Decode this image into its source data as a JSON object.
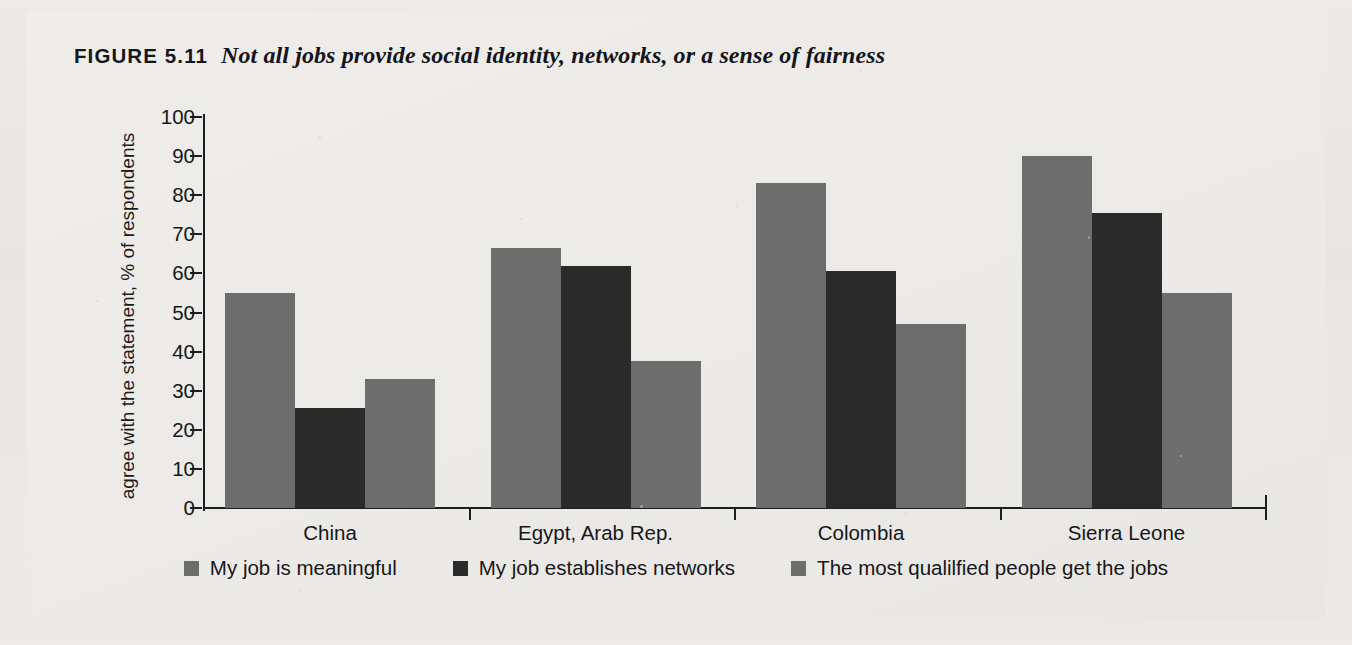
{
  "figure": {
    "label": "FIGURE 5.11",
    "title": "Not all jobs provide social identity, networks, or a sense of fairness"
  },
  "axes": {
    "ylabel": "agree with the statement, % of respondents",
    "yticks": [
      "0",
      "10",
      "20",
      "30",
      "40",
      "50",
      "60",
      "70",
      "80",
      "90",
      "100"
    ],
    "ymin": 0,
    "ymax": 100
  },
  "legend": [
    {
      "label": "My job is meaningful",
      "color": "#6d6d6d",
      "swatch_name": "legend-swatch-meaningful"
    },
    {
      "label": "My job establishes networks",
      "color": "#2a2a2b",
      "swatch_name": "legend-swatch-networks"
    },
    {
      "label": "The most qualilfied people get the jobs",
      "color": "#6d6d6d",
      "swatch_name": "legend-swatch-qualified"
    }
  ],
  "chart_data": {
    "type": "bar",
    "title": "Not all jobs provide social identity, networks, or a sense of fairness",
    "xlabel": "",
    "ylabel": "agree with the statement, % of respondents",
    "ylim": [
      0,
      100
    ],
    "ytick_step": 10,
    "grid": false,
    "legend_position": "bottom",
    "categories": [
      "China",
      "Egypt, Arab Rep.",
      "Colombia",
      "Sierra Leone"
    ],
    "series": [
      {
        "name": "My job is meaningful",
        "color": "#6d6d6d",
        "values": [
          55,
          66.5,
          83,
          90
        ]
      },
      {
        "name": "My job establishes networks",
        "color": "#2a2a2b",
        "values": [
          25.5,
          62,
          60.5,
          75.5
        ]
      },
      {
        "name": "The most qualilfied people get the jobs",
        "color": "#6d6d6d",
        "values": [
          33,
          37.5,
          47,
          55
        ]
      }
    ]
  }
}
